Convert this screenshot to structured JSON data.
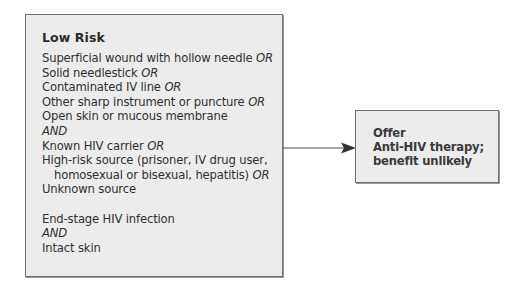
{
  "left_box": {
    "title": "Low Risk",
    "lines": [
      {
        "text": "Superficial wound with hollow needle ",
        "suffix": "OR",
        "indent": false
      },
      {
        "text": "Solid needlestick ",
        "suffix": "OR",
        "indent": false
      },
      {
        "text": "Contaminated IV line ",
        "suffix": "OR",
        "indent": false
      },
      {
        "text": "Other sharp instrument or puncture ",
        "suffix": "OR",
        "indent": false
      },
      {
        "text": "Open skin or mucous membrane",
        "suffix": "",
        "indent": false
      },
      {
        "text": "",
        "suffix": "AND",
        "indent": false
      },
      {
        "text": "Known HIV carrier ",
        "suffix": "OR",
        "indent": false
      },
      {
        "text": "High-risk source (prisoner, IV drug user,",
        "suffix": "",
        "indent": false
      },
      {
        "text": "homosexual or bisexual, hepatitis) ",
        "suffix": "OR",
        "indent": true
      },
      {
        "text": "Unknown source",
        "suffix": "",
        "indent": false
      },
      {
        "text": "",
        "suffix": "",
        "indent": false,
        "gap": true
      },
      {
        "text": "End-stage HIV infection",
        "suffix": "",
        "indent": false
      },
      {
        "text": "",
        "suffix": "AND",
        "indent": false
      },
      {
        "text": "Intact skin",
        "suffix": "",
        "indent": false
      }
    ]
  },
  "right_box": {
    "lines": [
      "Offer",
      "Anti-HIV therapy;",
      "benefit unlikely"
    ]
  },
  "colors": {
    "box_fill": "#ececec",
    "box_border": "#6e6e6e",
    "text": "#2a2a2a"
  }
}
